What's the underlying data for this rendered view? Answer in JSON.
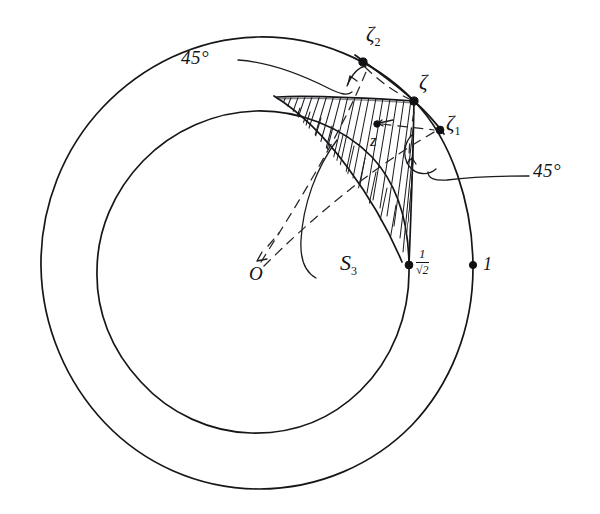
{
  "figure": {
    "ink_color": "#16161a",
    "background": "#ffffff",
    "center_label": "O",
    "outer_radius_label": "1",
    "inner_radius_label_num": "1",
    "inner_radius_label_den": "√2"
  },
  "points": [
    {
      "id": "origin",
      "name": "O",
      "label": "O",
      "x": 256,
      "y": 272,
      "dot": false
    },
    {
      "id": "zeta",
      "name": "zeta",
      "label": "ζ",
      "x": 414,
      "y": 101,
      "dot": true
    },
    {
      "id": "zeta1",
      "name": "zeta-1",
      "label": "ζ",
      "sub": "1",
      "x": 440,
      "y": 130,
      "dot": true
    },
    {
      "id": "zeta2",
      "name": "zeta-2",
      "label": "ζ",
      "sub": "2",
      "x": 363,
      "y": 62,
      "dot": true
    },
    {
      "id": "z-interior",
      "name": "z",
      "label": "z",
      "x": 377,
      "y": 124,
      "dot": true
    },
    {
      "id": "inner-radius",
      "name": "inner-radius-point",
      "label": "1/√2",
      "x": 409,
      "y": 265,
      "dot": true
    },
    {
      "id": "outer-radius",
      "name": "outer-radius-point",
      "label": "1",
      "x": 473,
      "y": 265,
      "dot": true
    }
  ],
  "labels": {
    "zeta": "ζ",
    "zeta1_base": "ζ",
    "zeta1_sub": "1",
    "zeta2_base": "ζ",
    "zeta2_sub": "2",
    "z": "z",
    "origin": "O",
    "region_base": "S",
    "region_sub": "3",
    "angle_top": "45°",
    "angle_right": "45°",
    "radius_outer": "1",
    "radius_inner_num": "1",
    "radius_inner_den": "√2"
  },
  "geometry": {
    "center": {
      "x": 256,
      "y": 272
    },
    "outer_circle_radius": 217,
    "inner_circle_radius": 160,
    "annulus": true,
    "shaded_region": "S3",
    "hatching": "diagonal-pen-hatch",
    "dashed_rays_from_origin": 2,
    "angle_markers": 2,
    "angle_value_degrees": 45
  }
}
